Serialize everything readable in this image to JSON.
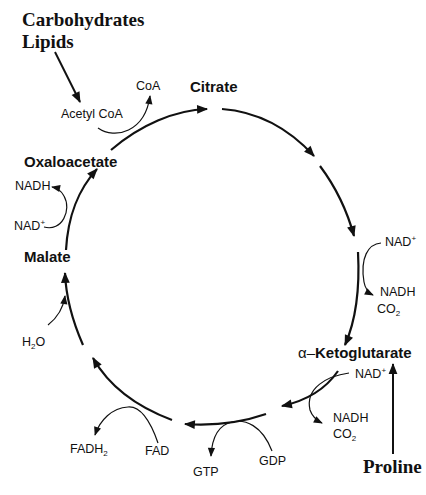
{
  "figure": {
    "colors": {
      "line": "#111111",
      "background": "#ffffff"
    }
  },
  "inputs": {
    "carbohydrates": "Carbohydrates",
    "lipids": "Lipids",
    "proline": "Proline"
  },
  "intermediates": {
    "citrate": "Citrate",
    "ketoglutarate_prefix": "α–",
    "ketoglutarate": "Ketoglutarate",
    "malate": "Malate",
    "oxaloacetate": "Oxaloacetate"
  },
  "cofactors": {
    "acetyl_coa": "Acetyl CoA",
    "coa": "CoA",
    "nad_right_top": {
      "base": "NAD",
      "sup": "+"
    },
    "nadh_right_top": "NADH",
    "co2_right_top": {
      "base": "CO",
      "sub": "2"
    },
    "nad_right_bottom": {
      "base": "NAD",
      "sup": "+"
    },
    "nadh_right_bottom": "NADH",
    "co2_right_bottom": {
      "base": "CO",
      "sub": "2"
    },
    "gdp": "GDP",
    "gtp": "GTP",
    "fad": "FAD",
    "fadh2": {
      "base": "FADH",
      "sub": "2"
    },
    "h2o": {
      "base": "H",
      "sub": "2",
      "tail": "O"
    },
    "nad_left": {
      "base": "NAD",
      "sup": "+"
    },
    "nadh_left": "NADH"
  }
}
